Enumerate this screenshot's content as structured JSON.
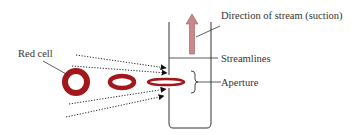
{
  "diagram": {
    "labels": {
      "red_cell": "Red cell",
      "direction": "Direction of stream (suction)",
      "streamlines": "Streamlines",
      "aperture": "Aperture"
    },
    "colors": {
      "cell": "#a3161a",
      "arrow": "#c9898a",
      "arrow_stroke": "#9a5a5a",
      "line": "#333333"
    },
    "cells": [
      {
        "shape": "ring",
        "cx": 76,
        "cy": 81,
        "rx": 11,
        "ry": 11
      },
      {
        "shape": "flattened-ring",
        "cx": 122,
        "cy": 81,
        "rx": 13,
        "ry": 6
      },
      {
        "shape": "elongated-ring",
        "cx": 168,
        "cy": 81,
        "rx": 20,
        "ry": 3.5
      }
    ]
  }
}
